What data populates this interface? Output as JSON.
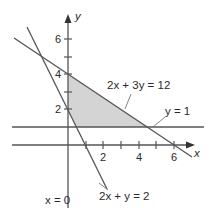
{
  "diagram": {
    "type": "linear-inequality-feasible-region",
    "axes": {
      "x_label": "x",
      "y_label": "y",
      "x_ticks": [
        "2",
        "4",
        "6"
      ],
      "y_ticks": [
        "2",
        "4",
        "6"
      ]
    },
    "lines": [
      {
        "id": "line-2x3y",
        "label": "2x + 3y = 12"
      },
      {
        "id": "line-y1",
        "label": "y = 1"
      },
      {
        "id": "line-2xy",
        "label": "2x + y = 2"
      },
      {
        "id": "line-x0",
        "label": "x = 0"
      }
    ],
    "region": {
      "description": "shaded feasible region",
      "fill": "#d4d4d4"
    },
    "colors": {
      "line": "#4a4a4a",
      "text": "#2a2a2a",
      "shade": "#d4d4d4"
    }
  }
}
